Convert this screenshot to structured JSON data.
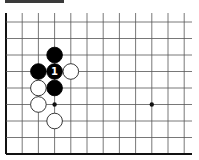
{
  "board": {
    "origin": {
      "x": 6,
      "y": 22
    },
    "spacing": {
      "x": 16.2,
      "y": 16.5
    },
    "columns": 12,
    "rows": 9,
    "top_y": 13,
    "right_x": 192,
    "edges": {
      "left": true,
      "bottom": true,
      "top": false,
      "right": false
    },
    "colors": {
      "line": "#555555",
      "edge": "#111111",
      "black_stone": "#000000",
      "white_stone": "#ffffff",
      "white_stone_stroke": "#222222",
      "label_on_black": "#ffffff",
      "header_bar": "#3a3a3a"
    }
  },
  "star_points": [
    {
      "col": 3,
      "row": 5
    },
    {
      "col": 9,
      "row": 5
    }
  ],
  "stones": [
    {
      "color": "black",
      "col": 3,
      "row": 2,
      "label": ""
    },
    {
      "color": "black",
      "col": 2,
      "row": 3,
      "label": ""
    },
    {
      "color": "black",
      "col": 3,
      "row": 3,
      "label": "1"
    },
    {
      "color": "white",
      "col": 4,
      "row": 3,
      "label": ""
    },
    {
      "color": "black",
      "col": 3,
      "row": 4,
      "label": ""
    },
    {
      "color": "white",
      "col": 2,
      "row": 4,
      "label": ""
    },
    {
      "color": "white",
      "col": 2,
      "row": 5,
      "label": ""
    },
    {
      "color": "white",
      "col": 3,
      "row": 6,
      "label": ""
    }
  ]
}
